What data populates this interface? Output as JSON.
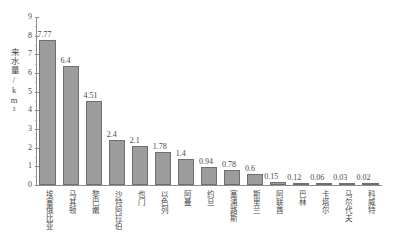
{
  "chart_data": {
    "type": "bar",
    "title": "",
    "xlabel": "",
    "ylabel": "来水量/km³",
    "ylim": [
      0,
      9
    ],
    "yticks": [
      0,
      1,
      2,
      3,
      4,
      5,
      6,
      7,
      8,
      9
    ],
    "ytick_labels": [
      "0",
      "1",
      "2",
      "3",
      "4",
      "5",
      "6",
      "7",
      "8",
      "9"
    ],
    "grid": false,
    "legend": "none",
    "bar_color": "#9c9c9c",
    "bar_edge_color": "#6f6f6f",
    "axis_color": "#8d8d8d",
    "text_color": "#4a4a4a",
    "categories": [
      "埃塞俄比亚",
      "马其顿",
      "黎巴嫩",
      "沙特阿拉伯",
      "也门",
      "以色列",
      "阿曼",
      "约旦",
      "塞浦路斯",
      "斯里兰",
      "阿联酋",
      "巴林",
      "卡塔尔",
      "马尔代夫",
      "科威特"
    ],
    "values": [
      7.77,
      6.4,
      4.51,
      2.4,
      2.1,
      1.78,
      1.4,
      0.94,
      0.78,
      0.6,
      0.15,
      0.12,
      0.06,
      0.03,
      0.02
    ],
    "value_labels": [
      "7.77",
      "6.4",
      "4.51",
      "2.4",
      "2.1",
      "1.78",
      "1.4",
      "0.94",
      "0.78",
      "0.6",
      "0.15",
      "0.12",
      "0.06",
      "0.03",
      "0.02"
    ]
  }
}
